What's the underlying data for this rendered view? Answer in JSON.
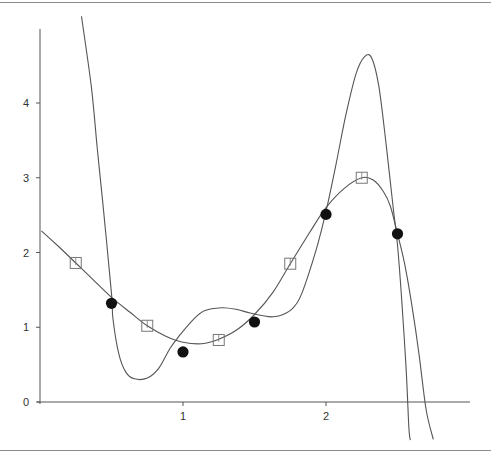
{
  "chart_data": {
    "type": "line",
    "title": "",
    "xlabel": "",
    "ylabel": "",
    "xlim": [
      0,
      3.0
    ],
    "ylim": [
      0,
      4.8
    ],
    "x_ticks": [
      1,
      2
    ],
    "x_tick_labels": [
      "1",
      "2"
    ],
    "y_ticks": [
      0,
      1,
      2,
      3,
      4
    ],
    "y_tick_labels": [
      "0",
      "1",
      "2",
      "3",
      "4"
    ],
    "grid": false,
    "legend": null,
    "series": [
      {
        "name": "filled-circle-points",
        "kind": "scatter",
        "marker": "filled-circle",
        "x": [
          0.5,
          1.0,
          1.5,
          2.0,
          2.5
        ],
        "y": [
          1.32,
          0.67,
          1.07,
          2.51,
          2.25
        ]
      },
      {
        "name": "open-square-points",
        "kind": "scatter",
        "marker": "open-square",
        "x": [
          0.25,
          0.75,
          1.25,
          1.75,
          2.25
        ],
        "y": [
          1.86,
          1.02,
          0.83,
          1.85,
          3.0
        ]
      },
      {
        "name": "high-degree-interpolating-curve",
        "kind": "line",
        "x": [
          0.29,
          0.36,
          0.4,
          0.44,
          0.5,
          0.51,
          0.55,
          0.6,
          0.66,
          0.75,
          0.83,
          0.91,
          0.98,
          1.07,
          1.15,
          1.27,
          1.37,
          1.47,
          1.57,
          1.63,
          1.7,
          1.77,
          1.83,
          1.93,
          2.0,
          2.07,
          2.14,
          2.21,
          2.27,
          2.32,
          2.37,
          2.42,
          2.47,
          2.5,
          2.53,
          2.56,
          2.58,
          2.59
        ],
        "y": [
          5.16,
          4.2,
          3.4,
          2.65,
          1.45,
          1.12,
          0.65,
          0.4,
          0.31,
          0.32,
          0.45,
          0.72,
          0.9,
          1.1,
          1.22,
          1.26,
          1.24,
          1.19,
          1.15,
          1.14,
          1.17,
          1.26,
          1.45,
          2.03,
          2.55,
          3.18,
          3.85,
          4.39,
          4.62,
          4.6,
          4.22,
          3.45,
          2.6,
          2.1,
          1.35,
          0.45,
          -0.35,
          -0.51
        ]
      },
      {
        "name": "smooth-fit-curve",
        "kind": "line",
        "x": [
          0.01,
          0.13,
          0.25,
          0.38,
          0.5,
          0.63,
          0.75,
          0.88,
          1.0,
          1.13,
          1.25,
          1.38,
          1.5,
          1.63,
          1.75,
          1.88,
          2.0,
          2.13,
          2.25,
          2.33,
          2.4,
          2.45,
          2.5,
          2.55,
          2.6,
          2.65,
          2.7,
          2.75
        ],
        "y": [
          2.29,
          2.08,
          1.86,
          1.62,
          1.4,
          1.2,
          1.02,
          0.88,
          0.8,
          0.78,
          0.84,
          0.97,
          1.17,
          1.47,
          1.85,
          2.25,
          2.6,
          2.86,
          3.0,
          2.97,
          2.82,
          2.62,
          2.25,
          1.85,
          1.3,
          0.65,
          -0.1,
          -0.5
        ]
      }
    ]
  },
  "plot": {
    "origin_px": [
      40,
      402
    ],
    "px_per_x": 143,
    "px_per_y": 74.75,
    "axis_top_px": 29,
    "axis_right_px": 470,
    "colors": {
      "axis": "#555555",
      "curve": "#555555",
      "marker_fill": "#111111",
      "square_stroke": "#777777",
      "label": "#333333",
      "frame": "#8a8a8a"
    }
  }
}
